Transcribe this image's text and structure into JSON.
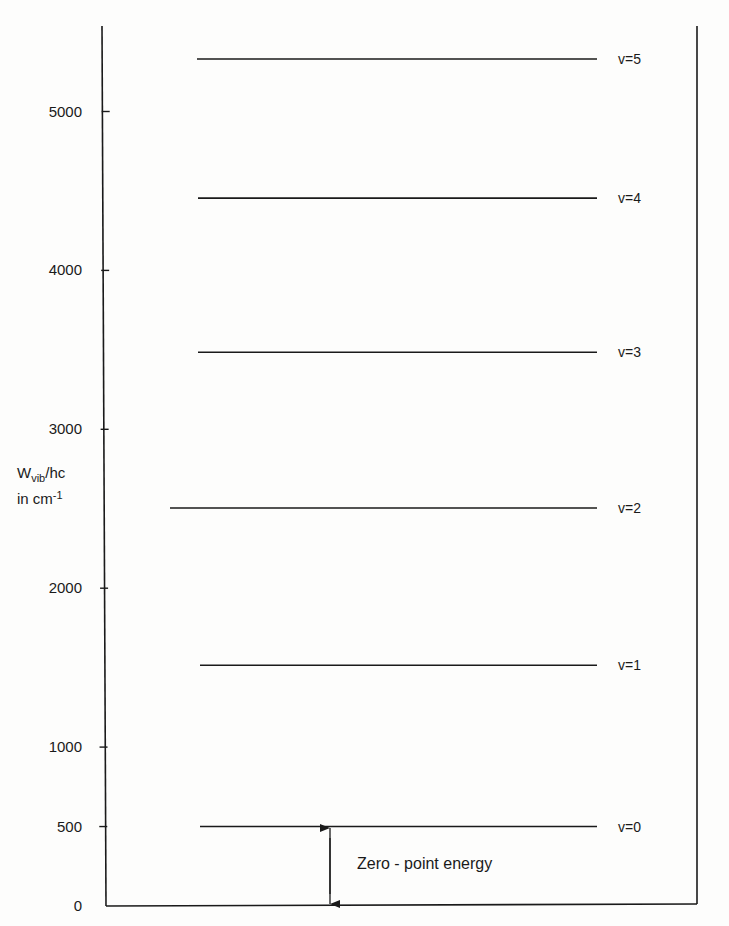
{
  "figure": {
    "y_axis": {
      "title_main": "W",
      "title_sub": "vib",
      "title_tail": "/hc",
      "units": "in cm",
      "units_sup": "-1",
      "ticks": [
        {
          "label": "0",
          "value": 0
        },
        {
          "label": "500",
          "value": 500
        },
        {
          "label": "1000",
          "value": 1000
        },
        {
          "label": "2000",
          "value": 2000
        },
        {
          "label": "3000",
          "value": 3000
        },
        {
          "label": "4000",
          "value": 4000
        },
        {
          "label": "5000",
          "value": 5000
        }
      ]
    },
    "vibrational_levels": [
      {
        "label": "v=0",
        "value": 500
      },
      {
        "label": "v=1",
        "value": 1515
      },
      {
        "label": "v=2",
        "value": 2505
      },
      {
        "label": "v=3",
        "value": 3485
      },
      {
        "label": "v=4",
        "value": 4455
      },
      {
        "label": "v=5",
        "value": 5330
      }
    ],
    "rotational_ladders": [
      {
        "name": "ladder-v0",
        "base_level": "v=0",
        "j_prefix": "J =",
        "j_levels": [
          0,
          1,
          2,
          3,
          4,
          5,
          6,
          7,
          8
        ],
        "labeled_j": [
          "0",
          "3",
          "4",
          "5",
          "6",
          "7",
          "8"
        ]
      },
      {
        "name": "ladder-v1",
        "base_level": "v=1",
        "j_prefix": "J =",
        "j_levels": [
          0,
          1,
          2,
          3,
          4,
          5,
          6,
          7,
          8
        ],
        "labeled_j": [
          "0",
          "3",
          "4",
          "5",
          "6",
          "7",
          "8"
        ]
      },
      {
        "name": "ladder-v2",
        "base_level": "v=2",
        "j_prefix": "J =",
        "j_levels": [
          0,
          1,
          2,
          3,
          4,
          5,
          6,
          7,
          8
        ],
        "labeled_j": [
          "0",
          "3",
          "4",
          "5",
          "6",
          "7",
          "8"
        ]
      }
    ],
    "annotation": {
      "zero_point_label": "Zero - point energy"
    }
  },
  "chart_data": {
    "type": "energy-level-diagram",
    "title": "",
    "ylabel": "W_vib/hc in cm^-1",
    "ylim": [
      0,
      5500
    ],
    "yticks": [
      0,
      500,
      1000,
      2000,
      3000,
      4000,
      5000
    ],
    "vibrational_levels": {
      "v=0": 500,
      "v=1": 1515,
      "v=2": 2505,
      "v=3": 3485,
      "v=4": 4455,
      "v=5": 5330
    },
    "rotational_ladders": [
      {
        "on": "v=0",
        "J": [
          0,
          1,
          2,
          3,
          4,
          5,
          6,
          7,
          8
        ],
        "offsets_cm-1": [
          0,
          35,
          85,
          165,
          300,
          460,
          640,
          850,
          1130
        ]
      },
      {
        "on": "v=1",
        "J": [
          0,
          1,
          2,
          3,
          4,
          5,
          6,
          7,
          8
        ],
        "offsets_cm-1": [
          0,
          35,
          85,
          165,
          300,
          460,
          650,
          870,
          1130
        ]
      },
      {
        "on": "v=2",
        "J": [
          0,
          1,
          2,
          3,
          4,
          5,
          6,
          7,
          8
        ],
        "offsets_cm-1": [
          0,
          35,
          85,
          165,
          300,
          460,
          660,
          860,
          1125
        ]
      }
    ],
    "annotations": [
      "Zero-point energy (0 to v=0, 500 cm^-1)"
    ],
    "grid": false,
    "legend": null
  }
}
